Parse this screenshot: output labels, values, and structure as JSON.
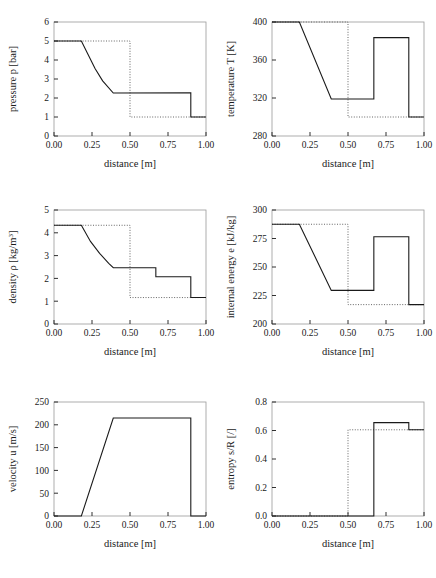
{
  "figure": {
    "background": "#ffffff",
    "line_color": "#1a1a1a",
    "frame_color": "#9a9a9a",
    "dotted_color": "#555555",
    "rows": 3,
    "cols": 2
  },
  "common": {
    "xlabel": "distance [m]",
    "xticks": [
      "0.00",
      "0.25",
      "0.50",
      "0.75",
      "1.00"
    ],
    "xlim": [
      0.0,
      1.0
    ]
  },
  "chart_data": [
    {
      "type": "line",
      "name": "pressure",
      "title": "",
      "xlabel": "distance [m]",
      "ylabel": "pressure p [bar]",
      "ylabel_parts": {
        "pre": "pressure p [bar]",
        "sup": ""
      },
      "xlim": [
        0.0,
        1.0
      ],
      "ylim": [
        0,
        6
      ],
      "xticks": [
        "0.00",
        "0.25",
        "0.50",
        "0.75",
        "1.00"
      ],
      "xtickvals": [
        0.0,
        0.25,
        0.5,
        0.75,
        1.0
      ],
      "yticks": [
        "0",
        "1",
        "2",
        "3",
        "4",
        "5",
        "6"
      ],
      "ytickvals": [
        0,
        1,
        2,
        3,
        4,
        5,
        6
      ],
      "grid": false,
      "series": [
        {
          "name": "initial condition",
          "style": "dotted",
          "x": [
            0.0,
            0.5,
            0.5,
            1.0
          ],
          "y": [
            5.0,
            5.0,
            1.0,
            1.0
          ]
        },
        {
          "name": "solution",
          "style": "solid",
          "x": [
            0.0,
            0.18,
            0.22,
            0.27,
            0.32,
            0.39,
            0.9,
            0.9,
            1.0
          ],
          "y": [
            5.0,
            5.0,
            4.35,
            3.55,
            2.9,
            2.26,
            2.28,
            1.0,
            1.0
          ]
        }
      ]
    },
    {
      "type": "line",
      "name": "temperature",
      "title": "",
      "xlabel": "distance [m]",
      "ylabel": "temperature T [K]",
      "ylabel_parts": {
        "pre": "temperature T [K]",
        "sup": ""
      },
      "xlim": [
        0.0,
        1.0
      ],
      "ylim": [
        280,
        400
      ],
      "xticks": [
        "0.00",
        "0.25",
        "0.50",
        "0.75",
        "1.00"
      ],
      "xtickvals": [
        0.0,
        0.25,
        0.5,
        0.75,
        1.0
      ],
      "yticks": [
        "280",
        "320",
        "360",
        "400"
      ],
      "ytickvals": [
        280,
        320,
        360,
        400
      ],
      "grid": false,
      "series": [
        {
          "name": "initial condition",
          "style": "dotted",
          "x": [
            0.0,
            0.5,
            0.5,
            1.0
          ],
          "y": [
            400.0,
            400.0,
            300.0,
            300.0
          ]
        },
        {
          "name": "solution",
          "style": "solid",
          "x": [
            0.0,
            0.18,
            0.39,
            0.67,
            0.67,
            0.9,
            0.9,
            1.0
          ],
          "y": [
            400.0,
            400.0,
            319.0,
            319.0,
            383.5,
            383.5,
            300.0,
            300.0
          ]
        }
      ]
    },
    {
      "type": "line",
      "name": "density",
      "title": "",
      "xlabel": "distance [m]",
      "ylabel": "density ρ [kg/m3]",
      "ylabel_parts": {
        "pre": "density ρ [kg/m",
        "sup": "3",
        "post": "]"
      },
      "xlim": [
        0.0,
        1.0
      ],
      "ylim": [
        0,
        5
      ],
      "xticks": [
        "0.00",
        "0.25",
        "0.50",
        "0.75",
        "1.00"
      ],
      "xtickvals": [
        0.0,
        0.25,
        0.5,
        0.75,
        1.0
      ],
      "yticks": [
        "0",
        "1",
        "2",
        "3",
        "4",
        "5"
      ],
      "ytickvals": [
        0,
        1,
        2,
        3,
        4,
        5
      ],
      "grid": false,
      "series": [
        {
          "name": "initial condition",
          "style": "dotted",
          "x": [
            0.0,
            0.5,
            0.5,
            1.0
          ],
          "y": [
            4.33,
            4.33,
            1.16,
            1.16
          ]
        },
        {
          "name": "solution",
          "style": "solid",
          "x": [
            0.0,
            0.18,
            0.24,
            0.3,
            0.36,
            0.39,
            0.67,
            0.67,
            0.9,
            0.9,
            1.0
          ],
          "y": [
            4.33,
            4.33,
            3.62,
            3.1,
            2.66,
            2.47,
            2.47,
            2.07,
            2.07,
            1.16,
            1.16
          ]
        }
      ]
    },
    {
      "type": "line",
      "name": "internal-energy",
      "title": "",
      "xlabel": "distance [m]",
      "ylabel": "internal energy e [kJ/kg]",
      "ylabel_parts": {
        "pre": "internal energy e [kJ/kg]",
        "sup": ""
      },
      "xlim": [
        0.0,
        1.0
      ],
      "ylim": [
        200,
        300
      ],
      "xticks": [
        "0.00",
        "0.25",
        "0.50",
        "0.75",
        "1.00"
      ],
      "xtickvals": [
        0.0,
        0.25,
        0.5,
        0.75,
        1.0
      ],
      "yticks": [
        "200",
        "225",
        "250",
        "275",
        "300"
      ],
      "ytickvals": [
        200,
        225,
        250,
        275,
        300
      ],
      "grid": false,
      "series": [
        {
          "name": "initial condition",
          "style": "dotted",
          "x": [
            0.0,
            0.5,
            0.5,
            1.0
          ],
          "y": [
            287.5,
            287.5,
            217.0,
            217.0
          ]
        },
        {
          "name": "solution",
          "style": "solid",
          "x": [
            0.0,
            0.18,
            0.39,
            0.67,
            0.67,
            0.9,
            0.9,
            1.0
          ],
          "y": [
            287.5,
            287.5,
            229.5,
            229.5,
            276.5,
            276.5,
            217.0,
            217.0
          ]
        }
      ]
    },
    {
      "type": "line",
      "name": "velocity",
      "title": "",
      "xlabel": "distance [m]",
      "ylabel": "velocity u [m/s]",
      "ylabel_parts": {
        "pre": "velocity u [m/s]",
        "sup": ""
      },
      "xlim": [
        0.0,
        1.0
      ],
      "ylim": [
        0,
        250
      ],
      "xticks": [
        "0.00",
        "0.25",
        "0.50",
        "0.75",
        "1.00"
      ],
      "xtickvals": [
        0.0,
        0.25,
        0.5,
        0.75,
        1.0
      ],
      "yticks": [
        "0",
        "50",
        "100",
        "150",
        "200",
        "250"
      ],
      "ytickvals": [
        0,
        50,
        100,
        150,
        200,
        250
      ],
      "grid": false,
      "series": [
        {
          "name": "solution",
          "style": "solid",
          "x": [
            0.0,
            0.18,
            0.39,
            0.9,
            0.9,
            1.0
          ],
          "y": [
            0.0,
            0.0,
            215.0,
            215.0,
            0.0,
            0.0
          ]
        }
      ]
    },
    {
      "type": "line",
      "name": "entropy",
      "title": "",
      "xlabel": "distance [m]",
      "ylabel": "entropy s/R [/]",
      "ylabel_parts": {
        "pre": "entropy s/R [/]",
        "sup": ""
      },
      "xlim": [
        0.0,
        1.0
      ],
      "ylim": [
        0.0,
        0.8
      ],
      "xticks": [
        "0.00",
        "0.25",
        "0.50",
        "0.75",
        "1.00"
      ],
      "xtickvals": [
        0.0,
        0.25,
        0.5,
        0.75,
        1.0
      ],
      "yticks": [
        "0.0",
        "0.2",
        "0.4",
        "0.6",
        "0.8"
      ],
      "ytickvals": [
        0.0,
        0.2,
        0.4,
        0.6,
        0.8
      ],
      "grid": false,
      "series": [
        {
          "name": "initial condition",
          "style": "dotted",
          "x": [
            0.0,
            0.5,
            0.5,
            1.0
          ],
          "y": [
            0.0,
            0.0,
            0.605,
            0.605
          ]
        },
        {
          "name": "solution",
          "style": "solid",
          "x": [
            0.0,
            0.67,
            0.67,
            0.9,
            0.9,
            1.0
          ],
          "y": [
            0.0,
            0.0,
            0.655,
            0.655,
            0.605,
            0.605
          ]
        }
      ]
    }
  ]
}
